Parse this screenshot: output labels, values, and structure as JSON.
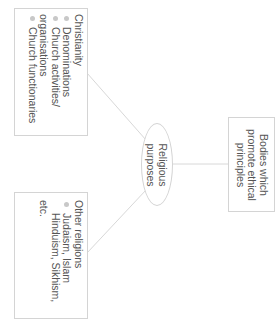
{
  "diagram": {
    "orientation": "rotated-90-clockwise",
    "center_node": {
      "label_line1": "Religious",
      "label_line2": "purposes"
    },
    "right_node": {
      "line1": "Bodies which",
      "line2": "promote ethical",
      "line3": "principles"
    },
    "top_node": {
      "title": "Christianity",
      "items": [
        "Denominations",
        "Church activities/",
        "Church functionaries"
      ],
      "item2_continuation": "organisations"
    },
    "bottom_node": {
      "title": "Other religions",
      "item_line1": "Judaism, Islam",
      "item_line2": "Hinduism, Sikhism,",
      "item_line3": "etc."
    },
    "colors": {
      "border": "#d4d4d4",
      "text": "#555555",
      "bullet": "#c8c8c8",
      "connector": "#d8d8d8"
    }
  }
}
